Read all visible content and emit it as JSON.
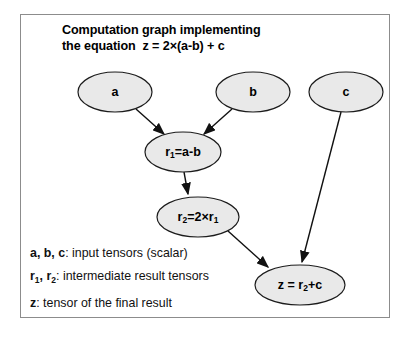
{
  "figure": {
    "title_line1": "Computation graph implementing",
    "title_line2_prefix": "the equation",
    "title_equation": "z = 2×(a-b) + c",
    "border_color": "#8c8c8c",
    "node_fill": "#e9e9e9",
    "node_stroke": "#1c1c1c",
    "edge_color": "#111111",
    "background": "#ffffff"
  },
  "nodes": [
    {
      "id": "a",
      "label": "a",
      "cx": 115,
      "cy": 92,
      "rx": 37,
      "ry": 20
    },
    {
      "id": "b",
      "label": "b",
      "cx": 253,
      "cy": 92,
      "rx": 37,
      "ry": 20
    },
    {
      "id": "c",
      "label": "c",
      "cx": 346,
      "cy": 92,
      "rx": 37,
      "ry": 20
    },
    {
      "id": "r1",
      "label": "r1=a-b",
      "base": "r",
      "sub": "1",
      "rest": "=a-b",
      "cx": 183,
      "cy": 152,
      "rx": 38,
      "ry": 20
    },
    {
      "id": "r2",
      "label": "r2=2×r1",
      "cx": 198,
      "cy": 217,
      "rx": 41,
      "ry": 20
    },
    {
      "id": "z",
      "label": "z = r2+c",
      "cx": 300,
      "cy": 285,
      "rx": 45,
      "ry": 20
    }
  ],
  "edges": [
    {
      "from": "a",
      "to": "r1"
    },
    {
      "from": "b",
      "to": "r1"
    },
    {
      "from": "r1",
      "to": "r2"
    },
    {
      "from": "r2",
      "to": "z"
    },
    {
      "from": "c",
      "to": "z"
    }
  ],
  "legend": [
    {
      "symbols": "a, b, c",
      "description": ": input tensors (scalar)"
    },
    {
      "symbols": "r1, r2",
      "description": ": intermediate result tensors"
    },
    {
      "symbols": "z",
      "description": ": tensor of the final result"
    }
  ]
}
